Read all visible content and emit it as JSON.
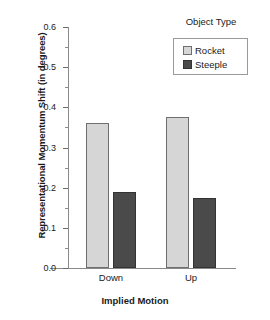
{
  "chart_data": {
    "type": "bar",
    "title": "",
    "xlabel": "Implied Motion",
    "ylabel": "Representational Momentum Shift (in degrees)",
    "categories": [
      "Down",
      "Up"
    ],
    "series": [
      {
        "name": "Rocket",
        "values": [
          0.36,
          0.375
        ],
        "color": "#d6d6d6"
      },
      {
        "name": "Steeple",
        "values": [
          0.19,
          0.175
        ],
        "color": "#4a4a4a"
      }
    ],
    "ylim": [
      0.0,
      0.6
    ],
    "ytick_labels": [
      "0.0",
      "0.1",
      "0.2",
      "0.3",
      "0.4",
      "0.5",
      "0.6"
    ],
    "ytick_values": [
      0.0,
      0.1,
      0.2,
      0.3,
      0.4,
      0.5,
      0.6
    ],
    "yminor_values": [
      0.05,
      0.15,
      0.25,
      0.35,
      0.45,
      0.55
    ],
    "grid": false,
    "legend": {
      "title": "Object Type",
      "position": "top-right",
      "entries": [
        "Rocket",
        "Steeple"
      ]
    }
  }
}
